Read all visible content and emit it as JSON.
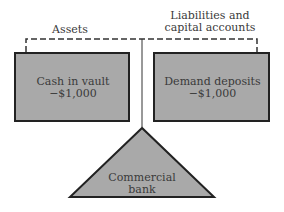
{
  "diagram": {
    "left_label": "Assets",
    "right_label_line1": "Liabilities and",
    "right_label_line2": "capital accounts",
    "left_box": {
      "line1": "Cash in vault",
      "line2": "−$1,000"
    },
    "right_box": {
      "line1": "Demand deposits",
      "line2": "−$1,000"
    },
    "fulcrum": {
      "line1": "Commercial",
      "line2": "bank"
    },
    "colors": {
      "fill": "#a9a9a9",
      "stroke": "#222222",
      "background": "#ffffff"
    }
  }
}
